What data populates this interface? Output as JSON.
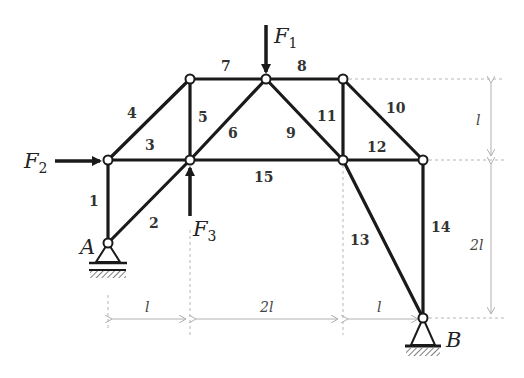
{
  "diagram": {
    "type": "plane truss",
    "members": [
      {
        "id": "1",
        "label": "1"
      },
      {
        "id": "2",
        "label": "2"
      },
      {
        "id": "3",
        "label": "3"
      },
      {
        "id": "4",
        "label": "4"
      },
      {
        "id": "5",
        "label": "5"
      },
      {
        "id": "6",
        "label": "6"
      },
      {
        "id": "7",
        "label": "7"
      },
      {
        "id": "8",
        "label": "8"
      },
      {
        "id": "9",
        "label": "9"
      },
      {
        "id": "10",
        "label": "10"
      },
      {
        "id": "11",
        "label": "11"
      },
      {
        "id": "12",
        "label": "12"
      },
      {
        "id": "13",
        "label": "13"
      },
      {
        "id": "14",
        "label": "14"
      },
      {
        "id": "15",
        "label": "15"
      }
    ],
    "forces": {
      "f1": {
        "symbol": "F",
        "sub": "1",
        "direction": "down"
      },
      "f2": {
        "symbol": "F",
        "sub": "2",
        "direction": "right"
      },
      "f3": {
        "symbol": "F",
        "sub": "3",
        "direction": "up"
      }
    },
    "supports": {
      "a": {
        "label": "A",
        "type": "pin"
      },
      "b": {
        "label": "B",
        "type": "pin"
      }
    },
    "dimensions": {
      "horizontal": [
        "l",
        "2l",
        "l"
      ],
      "vertical": [
        "l",
        "2l"
      ]
    },
    "colors": {
      "member": "#1a1a1a",
      "dimension": "#b0b0b0"
    }
  }
}
